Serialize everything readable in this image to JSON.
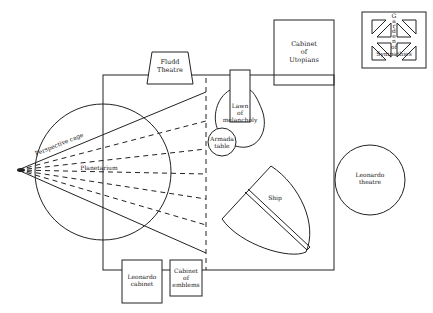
{
  "diagram": {
    "title": "",
    "colors": {
      "line": "#222222",
      "background": "#ffffff"
    },
    "labels": {
      "fludd_theatre": [
        "Fludd",
        "Theatre"
      ],
      "cabinet_utopians": [
        "Cabinet",
        "of",
        "Utopians"
      ],
      "garden_sympathies_vertical": [
        "G",
        "a",
        "r",
        "d",
        "e",
        "n"
      ],
      "garden_sympathies_of": "of",
      "garden_sympathies_name": "Sympathies",
      "lawn_melancholy": [
        "Lawn",
        "of",
        "melancholy"
      ],
      "armada_table": [
        "Armada",
        "table"
      ],
      "perspective_cage": "Perspective cage",
      "planetarium": "Planetarium",
      "ship": "Ship",
      "leonardo_theatre": [
        "Leonardo",
        "theatre"
      ],
      "leonardo_cabinet": [
        "Leonardo",
        "cabinet"
      ],
      "cabinet_emblems": [
        "Cabinet",
        "of",
        "emblems"
      ],
      "eye": "eye"
    }
  }
}
